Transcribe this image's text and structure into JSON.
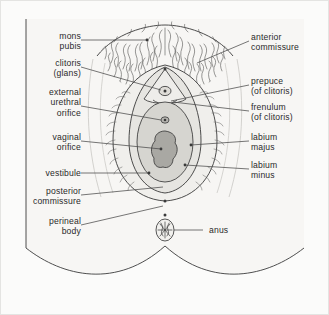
{
  "figure": {
    "background_color": "#fbfbfa",
    "frame_color": "#e4e4e2",
    "ink_color": "#3a3a3a",
    "text_color": "#2a2a2a",
    "skin_fill": "#f7f6f4",
    "labium_majus_fill": "#f0efec",
    "labium_minus_fill": "#e6e5e1",
    "vestibule_fill": "#d6d5d0",
    "vaginal_orifice_fill": "#a9a8a3",
    "leader_color": "#4a4a4a"
  },
  "labels": {
    "left": [
      {
        "id": "mons-pubis",
        "text": "mons\npubis"
      },
      {
        "id": "clitoris-glans",
        "text": "clitoris\n(glans)"
      },
      {
        "id": "external-urethral-orifice",
        "text": "external\nurethral\norifice"
      },
      {
        "id": "vaginal-orifice",
        "text": "vaginal\norifice"
      },
      {
        "id": "vestibule",
        "text": "vestibule"
      },
      {
        "id": "posterior-commissure",
        "text": "posterior\ncommissure"
      },
      {
        "id": "perineal-body",
        "text": "perineal\nbody"
      }
    ],
    "right": [
      {
        "id": "anterior-commissure",
        "text": "anterior\ncommissure"
      },
      {
        "id": "prepuce-of-clitoris",
        "text": "prepuce\n(of clitoris)"
      },
      {
        "id": "frenulum-of-clitoris",
        "text": "frenulum\n(of clitoris)"
      },
      {
        "id": "labium-majus",
        "text": "labium\nmajus"
      },
      {
        "id": "labium-minus",
        "text": "labium\nminus"
      },
      {
        "id": "anus",
        "text": "anus"
      }
    ]
  },
  "structures": [
    {
      "id": "mons-pubis",
      "label": "mons pubis"
    },
    {
      "id": "anterior-commissure",
      "label": "anterior commissure"
    },
    {
      "id": "clitoris-glans",
      "label": "clitoris (glans)"
    },
    {
      "id": "prepuce-of-clitoris",
      "label": "prepuce (of clitoris)"
    },
    {
      "id": "frenulum-of-clitoris",
      "label": "frenulum (of clitoris)"
    },
    {
      "id": "external-urethral-orifice",
      "label": "external urethral orifice"
    },
    {
      "id": "vaginal-orifice",
      "label": "vaginal orifice"
    },
    {
      "id": "vestibule",
      "label": "vestibule"
    },
    {
      "id": "labium-majus",
      "label": "labium majus"
    },
    {
      "id": "labium-minus",
      "label": "labium minus"
    },
    {
      "id": "posterior-commissure",
      "label": "posterior commissure"
    },
    {
      "id": "perineal-body",
      "label": "perineal body"
    },
    {
      "id": "anus",
      "label": "anus"
    }
  ]
}
